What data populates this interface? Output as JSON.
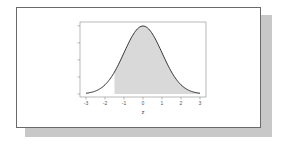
{
  "chart_data": {
    "type": "area",
    "title": "",
    "xlabel": "z",
    "ylabel": "",
    "xlim": [
      -3,
      3
    ],
    "ylim": [
      0,
      0.4
    ],
    "x_ticks": [
      "-3",
      "-2",
      "-1",
      "0",
      "1",
      "2",
      "3"
    ],
    "y_ticks": [
      "0.0",
      "0.1",
      "0.2",
      "0.3",
      "0.4"
    ],
    "y_tick_labels_visible": false,
    "curve": "standard normal density",
    "series": [
      {
        "name": "standard normal pdf",
        "x": [
          -3,
          -2.5,
          -2,
          -1.5,
          -1,
          -0.5,
          0,
          0.5,
          1,
          1.5,
          2,
          2.5,
          3
        ],
        "values": [
          0.004,
          0.018,
          0.054,
          0.13,
          0.242,
          0.352,
          0.399,
          0.352,
          0.242,
          0.13,
          0.054,
          0.018,
          0.004
        ]
      }
    ],
    "shaded_region": {
      "from": -1.5,
      "to": 3,
      "color": "#d9d9d9"
    },
    "grid": false,
    "legend": null
  },
  "colors": {
    "curve": "#333333",
    "shade": "#d9d9d9",
    "frame_border": "#6a6a6a",
    "shadow": "#c8c8c8"
  }
}
